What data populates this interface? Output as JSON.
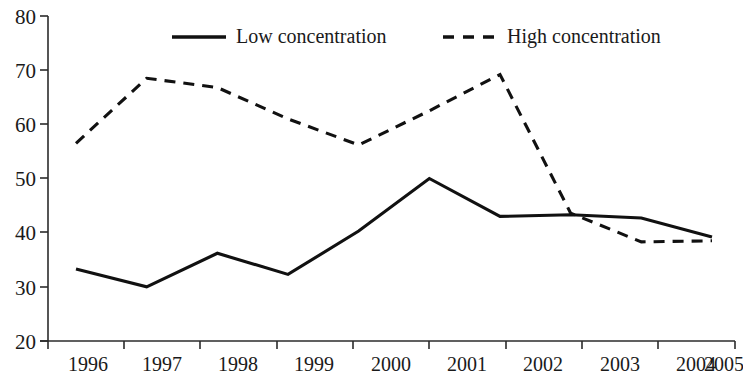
{
  "chart_data": {
    "type": "line",
    "title": "",
    "xlabel": "",
    "ylabel": "",
    "categories": [
      "1996",
      "1997",
      "1998",
      "1999",
      "2000",
      "2001",
      "2002",
      "2003",
      "2004",
      "2005"
    ],
    "x_tick_labels": [
      "1996",
      "1997",
      "1998",
      "1999",
      "2000",
      "2001",
      "2002",
      "2003",
      "2004",
      "2005"
    ],
    "y_tick_labels": [
      "20",
      "30",
      "40",
      "50",
      "60",
      "70",
      "80"
    ],
    "y_ticks": [
      20,
      30,
      40,
      50,
      60,
      70,
      80
    ],
    "ylim": [
      20,
      80
    ],
    "grid": false,
    "legend_position": "top-center",
    "series": [
      {
        "name": "Low concentration",
        "style": "solid",
        "color": "#111111",
        "values": [
          33.3,
          30.0,
          36.2,
          32.3,
          40.3,
          50.0,
          43.0,
          43.3,
          42.7,
          39.2
        ]
      },
      {
        "name": "High concentration",
        "style": "dashed",
        "color": "#111111",
        "values": [
          56.5,
          68.5,
          66.8,
          61.0,
          56.2,
          62.5,
          69.2,
          43.6,
          38.3,
          38.5
        ]
      }
    ]
  },
  "legend": {
    "items": [
      {
        "label": "Low concentration",
        "style": "solid"
      },
      {
        "label": "High concentration",
        "style": "dashed"
      }
    ]
  },
  "axes": {
    "y_axis_name": "value-axis",
    "x_axis_name": "year-axis"
  }
}
